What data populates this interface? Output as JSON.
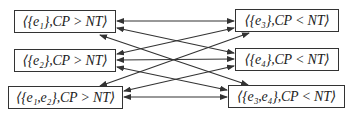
{
  "diagram": {
    "type": "bidirectional-graph",
    "left_nodes": [
      {
        "id": "L1",
        "label": "⟨{e₁},CP > NT⟩"
      },
      {
        "id": "L2",
        "label": "⟨{e₂},CP > NT⟩"
      },
      {
        "id": "L3",
        "label": "⟨{e₁,e₂},CP > NT⟩"
      }
    ],
    "right_nodes": [
      {
        "id": "R1",
        "label": "⟨{e₃},CP < NT⟩"
      },
      {
        "id": "R2",
        "label": "⟨{e₄},CP < NT⟩"
      },
      {
        "id": "R3",
        "label": "⟨{e₃,e₄},CP < NT⟩"
      }
    ],
    "edges": [
      {
        "from": "L1",
        "to": "R1",
        "direction": "both"
      },
      {
        "from": "L1",
        "to": "R2",
        "direction": "both"
      },
      {
        "from": "L1",
        "to": "R3",
        "direction": "both"
      },
      {
        "from": "L2",
        "to": "R1",
        "direction": "both"
      },
      {
        "from": "L2",
        "to": "R2",
        "direction": "both"
      },
      {
        "from": "L2",
        "to": "R3",
        "direction": "both"
      },
      {
        "from": "L3",
        "to": "R1",
        "direction": "both"
      },
      {
        "from": "L3",
        "to": "R2",
        "direction": "both"
      },
      {
        "from": "L3",
        "to": "R3",
        "direction": "both"
      }
    ],
    "colors": {
      "stroke": "#333333",
      "background": "#ffffff"
    }
  }
}
